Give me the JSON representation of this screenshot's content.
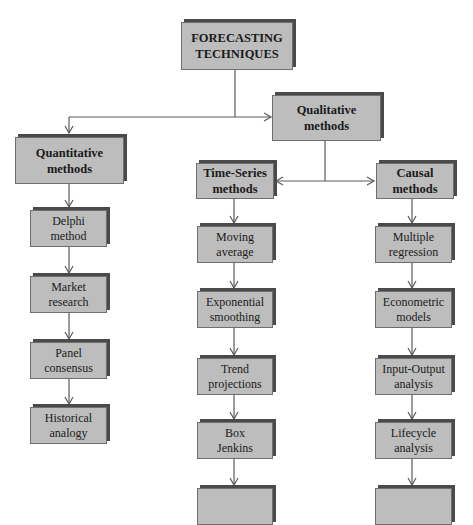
{
  "diagram": {
    "root": {
      "label": "FORECASTING\nTECHNIQUES"
    },
    "quantitative": {
      "label": "Quantitative\nmethods",
      "children": [
        {
          "label": "Delphi\nmethod"
        },
        {
          "label": "Market\nresearch"
        },
        {
          "label": "Panel\nconsensus"
        },
        {
          "label": "Historical\nanalogy"
        }
      ]
    },
    "qualitative": {
      "label": "Qualitative\nmethods",
      "time_series": {
        "label": "Time-Series\nmethods",
        "children": [
          {
            "label": "Moving\naverage"
          },
          {
            "label": "Exponential\nsmoothing"
          },
          {
            "label": "Trend\nprojections"
          },
          {
            "label": "Box\nJenkins"
          }
        ]
      },
      "causal": {
        "label": "Causal\nmethods",
        "children": [
          {
            "label": "Multiple\nregression"
          },
          {
            "label": "Econometric\nmodels"
          },
          {
            "label": "Input-Output\nanalysis"
          },
          {
            "label": "Lifecycle\nanalysis"
          }
        ]
      }
    },
    "colors": {
      "box_fill": "#bdbdbd",
      "box_shadow": "#4a4a4a",
      "connector": "#5a5a5a",
      "text": "#1a1a1a"
    }
  }
}
